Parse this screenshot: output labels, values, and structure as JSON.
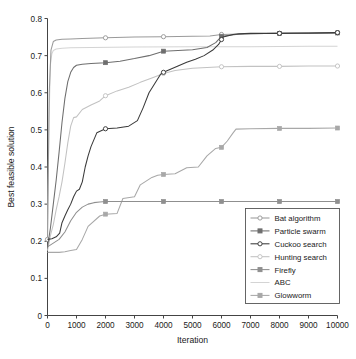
{
  "chart_data": {
    "type": "line",
    "title": "",
    "xlabel": "Iteration",
    "ylabel": "Best feasible solution",
    "xlim": [
      0,
      10000
    ],
    "ylim": [
      0,
      0.8
    ],
    "xticks": [
      0,
      1000,
      2000,
      3000,
      4000,
      5000,
      6000,
      7000,
      8000,
      9000,
      10000
    ],
    "xtick_labels": [
      "0",
      "1000",
      "2000",
      "3000",
      "4000",
      "5000",
      "6000",
      "7000",
      "8000",
      "9000",
      "10000"
    ],
    "yticks": [
      0,
      0.1,
      0.2,
      0.3,
      0.4,
      0.5,
      0.6,
      0.7,
      0.8
    ],
    "ytick_labels": [
      "0",
      "0.1",
      "0.2",
      "0.3",
      "0.4",
      "0.5",
      "0.6",
      "0.7",
      "0.8"
    ],
    "grid": false,
    "legend_position": "lower right",
    "series": [
      {
        "name": "Bat algorithm",
        "color": "#9a9a9a",
        "marker": "open-circle",
        "marker_x": [
          0,
          2000,
          4000,
          6000,
          8000,
          10000
        ],
        "x": [
          0,
          60,
          120,
          200,
          300,
          500,
          800,
          1200,
          2000,
          3000,
          4000,
          5000,
          5600,
          6000,
          7000,
          8000,
          9000,
          10000
        ],
        "y": [
          0.205,
          0.6,
          0.715,
          0.738,
          0.742,
          0.744,
          0.745,
          0.746,
          0.748,
          0.75,
          0.751,
          0.752,
          0.753,
          0.757,
          0.759,
          0.76,
          0.761,
          0.762
        ]
      },
      {
        "name": "Particle swarm",
        "color": "#6e6e6e",
        "marker": "filled-square",
        "marker_x": [
          2000,
          4000,
          6000,
          8000,
          10000
        ],
        "x": [
          0,
          100,
          200,
          300,
          400,
          500,
          600,
          700,
          800,
          900,
          1000,
          1200,
          1500,
          2000,
          2500,
          3000,
          3500,
          4000,
          4500,
          5000,
          5500,
          5800,
          6000,
          6500,
          7000,
          8000,
          9000,
          10000
        ],
        "y": [
          0.185,
          0.235,
          0.3,
          0.365,
          0.44,
          0.52,
          0.585,
          0.63,
          0.655,
          0.668,
          0.674,
          0.677,
          0.679,
          0.681,
          0.685,
          0.692,
          0.7,
          0.712,
          0.714,
          0.716,
          0.722,
          0.735,
          0.752,
          0.757,
          0.759,
          0.76,
          0.76,
          0.761
        ]
      },
      {
        "name": "Cuckoo search",
        "color": "#3a3a3a",
        "marker": "open-circle",
        "marker_x": [
          2000,
          4000,
          6000,
          8000,
          10000
        ],
        "x": [
          0,
          150,
          300,
          420,
          500,
          600,
          700,
          800,
          900,
          1000,
          1100,
          1200,
          1300,
          1400,
          1500,
          1700,
          2000,
          2400,
          2800,
          3100,
          3300,
          3500,
          3700,
          3900,
          4000,
          4200,
          4500,
          4800,
          5100,
          5400,
          5700,
          5900,
          6050,
          6200,
          6400,
          6600,
          7000,
          8000,
          9000,
          10000
        ],
        "y": [
          0.205,
          0.207,
          0.212,
          0.222,
          0.25,
          0.268,
          0.285,
          0.3,
          0.32,
          0.335,
          0.34,
          0.36,
          0.4,
          0.43,
          0.455,
          0.492,
          0.503,
          0.505,
          0.51,
          0.525,
          0.56,
          0.6,
          0.625,
          0.65,
          0.655,
          0.662,
          0.672,
          0.682,
          0.69,
          0.7,
          0.715,
          0.73,
          0.75,
          0.753,
          0.757,
          0.759,
          0.76,
          0.76,
          0.761,
          0.762
        ]
      },
      {
        "name": "Hunting search",
        "color": "#c2c2c2",
        "marker": "open-circle",
        "marker_x": [
          2000,
          4000,
          6000,
          8000,
          10000
        ],
        "x": [
          0,
          100,
          200,
          300,
          400,
          500,
          600,
          700,
          800,
          900,
          1000,
          1200,
          1500,
          1800,
          2000,
          2400,
          2800,
          3200,
          3600,
          4000,
          4400,
          5000,
          6000,
          7000,
          8000,
          9000,
          10000
        ],
        "y": [
          0.175,
          0.215,
          0.245,
          0.285,
          0.32,
          0.36,
          0.41,
          0.465,
          0.51,
          0.533,
          0.535,
          0.555,
          0.567,
          0.578,
          0.592,
          0.605,
          0.615,
          0.628,
          0.64,
          0.652,
          0.66,
          0.666,
          0.67,
          0.671,
          0.671,
          0.672,
          0.672
        ]
      },
      {
        "name": "Firefly",
        "color": "#8f8f8f",
        "marker": "filled-square",
        "marker_x": [
          2000,
          4000,
          6000,
          8000,
          10000
        ],
        "x": [
          0,
          200,
          400,
          600,
          800,
          1000,
          1200,
          1400,
          1600,
          1800,
          2000,
          3000,
          4000,
          5000,
          6000,
          7000,
          8000,
          9000,
          10000
        ],
        "y": [
          0.185,
          0.195,
          0.205,
          0.225,
          0.255,
          0.278,
          0.292,
          0.3,
          0.304,
          0.306,
          0.307,
          0.307,
          0.307,
          0.307,
          0.307,
          0.307,
          0.307,
          0.307,
          0.307
        ]
      },
      {
        "name": "ABC",
        "color": "#d4d4d4",
        "marker": "none",
        "marker_x": [],
        "x": [
          0,
          50,
          100,
          150,
          200,
          300,
          500,
          800,
          1500,
          3000,
          5000,
          7000,
          9000,
          10000
        ],
        "y": [
          0.205,
          0.52,
          0.675,
          0.705,
          0.714,
          0.718,
          0.72,
          0.721,
          0.722,
          0.723,
          0.724,
          0.724,
          0.725,
          0.725
        ]
      },
      {
        "name": "Glowworm",
        "color": "#a8a8a8",
        "marker": "filled-square",
        "marker_x": [
          2000,
          4000,
          6000,
          8000,
          10000
        ],
        "x": [
          0,
          400,
          600,
          800,
          1000,
          1200,
          1400,
          1800,
          2000,
          2400,
          2600,
          3000,
          3200,
          3600,
          3800,
          4000,
          4400,
          4800,
          5200,
          5500,
          5800,
          6000,
          6200,
          6400,
          6500,
          7000,
          8000,
          9000,
          10000
        ],
        "y": [
          0.17,
          0.17,
          0.172,
          0.175,
          0.178,
          0.205,
          0.24,
          0.268,
          0.273,
          0.275,
          0.315,
          0.32,
          0.352,
          0.372,
          0.378,
          0.38,
          0.382,
          0.398,
          0.4,
          0.43,
          0.45,
          0.453,
          0.47,
          0.492,
          0.502,
          0.503,
          0.504,
          0.504,
          0.505
        ]
      }
    ]
  },
  "legend": {
    "entries": [
      {
        "label": "Bat algorithm"
      },
      {
        "label": "Particle swarm"
      },
      {
        "label": "Cuckoo search"
      },
      {
        "label": "Hunting search"
      },
      {
        "label": "Firefly"
      },
      {
        "label": "ABC"
      },
      {
        "label": "Glowworm"
      }
    ]
  }
}
